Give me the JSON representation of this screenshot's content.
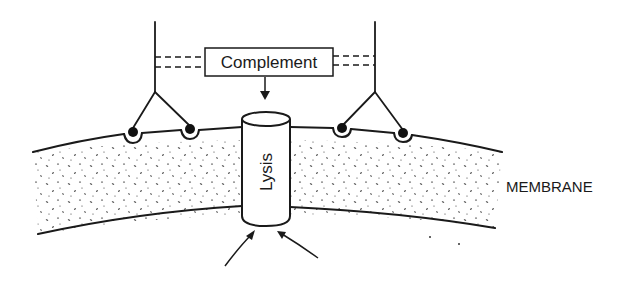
{
  "diagram": {
    "labels": {
      "complement": "Complement",
      "lysis": "Lysis",
      "membrane": "MEMBRANE"
    },
    "colors": {
      "ink": "#1a1a1a",
      "background": "#ffffff"
    }
  }
}
